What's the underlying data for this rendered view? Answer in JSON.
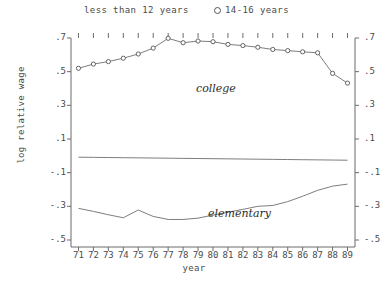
{
  "chart_data": {
    "type": "line",
    "title": "",
    "xlabel": "year",
    "ylabel": "log relative wage",
    "xlim": [
      70.5,
      89.5
    ],
    "ylim": [
      -0.5,
      0.7
    ],
    "grid": false,
    "x": [
      71,
      72,
      73,
      74,
      75,
      76,
      77,
      78,
      79,
      80,
      81,
      82,
      83,
      84,
      85,
      86,
      87,
      88,
      89
    ],
    "xtick_labels": [
      "71",
      "72",
      "73",
      "74",
      "75",
      "76",
      "77",
      "78",
      "79",
      "80",
      "81",
      "82",
      "83",
      "84",
      "85",
      "86",
      "87",
      "88",
      "89"
    ],
    "ytick_labels": [
      ".7",
      ".5",
      ".3",
      ".1",
      "-.1",
      "-.3",
      "-.5"
    ],
    "ytick_values": [
      0.7,
      0.5,
      0.3,
      0.1,
      -0.1,
      -0.3,
      -0.5
    ],
    "legend_position": "top",
    "series": [
      {
        "name": "14-16 years",
        "legend_label": "14-16 years",
        "marker": "open-circle",
        "annotation": "college",
        "values": [
          0.52,
          0.545,
          0.56,
          0.58,
          0.605,
          0.64,
          0.698,
          0.672,
          0.682,
          0.678,
          0.662,
          0.655,
          0.645,
          0.632,
          0.625,
          0.618,
          0.612,
          0.49,
          0.432
        ]
      },
      {
        "name": "less than 12 years",
        "legend_label": "less than 12 years",
        "marker": "none",
        "annotation": "elementary",
        "values": [
          -0.312,
          -0.33,
          -0.35,
          -0.368,
          -0.322,
          -0.36,
          -0.378,
          -0.378,
          -0.37,
          -0.352,
          -0.335,
          -0.318,
          -0.3,
          -0.295,
          -0.272,
          -0.24,
          -0.205,
          -0.18,
          -0.168
        ]
      },
      {
        "name": "reference-line",
        "legend_label": "",
        "marker": "none",
        "annotation": "",
        "values": [
          -0.008,
          -0.009,
          -0.01,
          -0.011,
          -0.012,
          -0.013,
          -0.014,
          -0.015,
          -0.016,
          -0.017,
          -0.018,
          -0.019,
          -0.02,
          -0.021,
          -0.022,
          -0.023,
          -0.024,
          -0.025,
          -0.026
        ]
      }
    ]
  },
  "legend": {
    "entry_lt12": "less than 12 years",
    "entry_1416": "14-16 years"
  },
  "axes": {
    "ylabel": "log relative wage",
    "xlabel": "year"
  },
  "annotations": {
    "college": "college",
    "elementary": "elementary"
  },
  "colors": {
    "axis": "#6a6a6a",
    "line": "#6e6e6e",
    "marker_stroke": "#555555",
    "text": "#4a4a4a",
    "background": "#ffffff"
  }
}
